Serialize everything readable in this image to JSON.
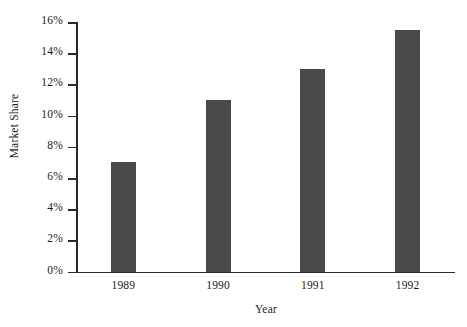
{
  "chart_data": {
    "type": "bar",
    "title": "",
    "subtitle": "",
    "xlabel": "Year",
    "ylabel": "Market Share",
    "categories": [
      "1989",
      "1990",
      "1991",
      "1992"
    ],
    "values": [
      7,
      11,
      13,
      15.5
    ],
    "value_labels": [
      "7%",
      "11%",
      "13%",
      "15.5%"
    ],
    "ylim": [
      0,
      16
    ],
    "ytick_values": [
      0,
      2,
      4,
      6,
      8,
      10,
      12,
      14,
      16
    ],
    "ytick_labels": [
      "0%",
      "2%",
      "4%",
      "6%",
      "8%",
      "10%",
      "12%",
      "14%",
      "16%"
    ],
    "grid": false,
    "legend": null,
    "series": [
      {
        "name": "Market Share",
        "values": [
          7,
          11,
          13,
          15.5
        ]
      }
    ],
    "bar_color": "#4a4a4a",
    "axis_color": "#2a2a2a",
    "background_color": "#ffffff"
  }
}
